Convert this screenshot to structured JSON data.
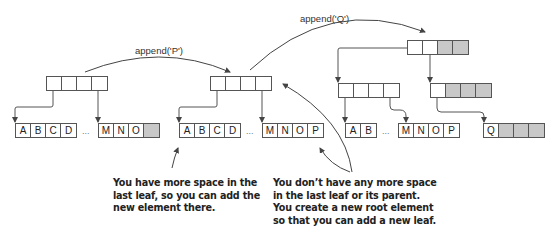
{
  "operations": {
    "append_p": "append('P')",
    "append_q": "append('Q')"
  },
  "states": [
    {
      "name": "before-append-p",
      "root": {
        "cells": [
          "",
          "",
          "",
          ""
        ],
        "filled": [
          false,
          false,
          false,
          false
        ]
      },
      "leaves": [
        {
          "cells": [
            "A",
            "B",
            "C",
            "D"
          ],
          "filled": [
            false,
            false,
            false,
            false
          ]
        },
        {
          "cells": [
            "M",
            "N",
            "O",
            ""
          ],
          "filled": [
            false,
            false,
            false,
            true
          ]
        }
      ]
    },
    {
      "name": "after-append-p",
      "root": {
        "cells": [
          "",
          "",
          "",
          ""
        ],
        "filled": [
          false,
          false,
          false,
          false
        ]
      },
      "leaves": [
        {
          "cells": [
            "A",
            "B",
            "C",
            "D"
          ],
          "filled": [
            false,
            false,
            false,
            false
          ]
        },
        {
          "cells": [
            "M",
            "N",
            "O",
            "P"
          ],
          "filled": [
            false,
            false,
            false,
            false
          ]
        }
      ]
    },
    {
      "name": "after-append-q",
      "root": {
        "cells": [
          "",
          "",
          "",
          ""
        ],
        "filled": [
          false,
          false,
          true,
          true
        ]
      },
      "internal": [
        {
          "cells": [
            "",
            "",
            "",
            ""
          ],
          "filled": [
            false,
            false,
            false,
            false
          ]
        },
        {
          "cells": [
            "",
            "",
            "",
            ""
          ],
          "filled": [
            false,
            true,
            true,
            true
          ]
        }
      ],
      "leaves": [
        {
          "cells": [
            "A",
            "B"
          ],
          "filled": [
            false,
            false
          ]
        },
        {
          "cells": [
            "M",
            "N",
            "O",
            "P"
          ],
          "filled": [
            false,
            false,
            false,
            false
          ]
        },
        {
          "cells": [
            "Q",
            "",
            "",
            ""
          ],
          "filled": [
            false,
            true,
            true,
            true
          ]
        }
      ]
    }
  ],
  "ellipsis": "...",
  "annotations": {
    "left": "You have more space in the\nlast leaf, so you can add the\nnew element there.",
    "right": "You don’t have any more space\nin the last leaf or its parent.\nYou create a new root element\nso that you can add a new leaf."
  },
  "colors": {
    "line": "#555555",
    "filled_cell": "#c8c8c8"
  }
}
